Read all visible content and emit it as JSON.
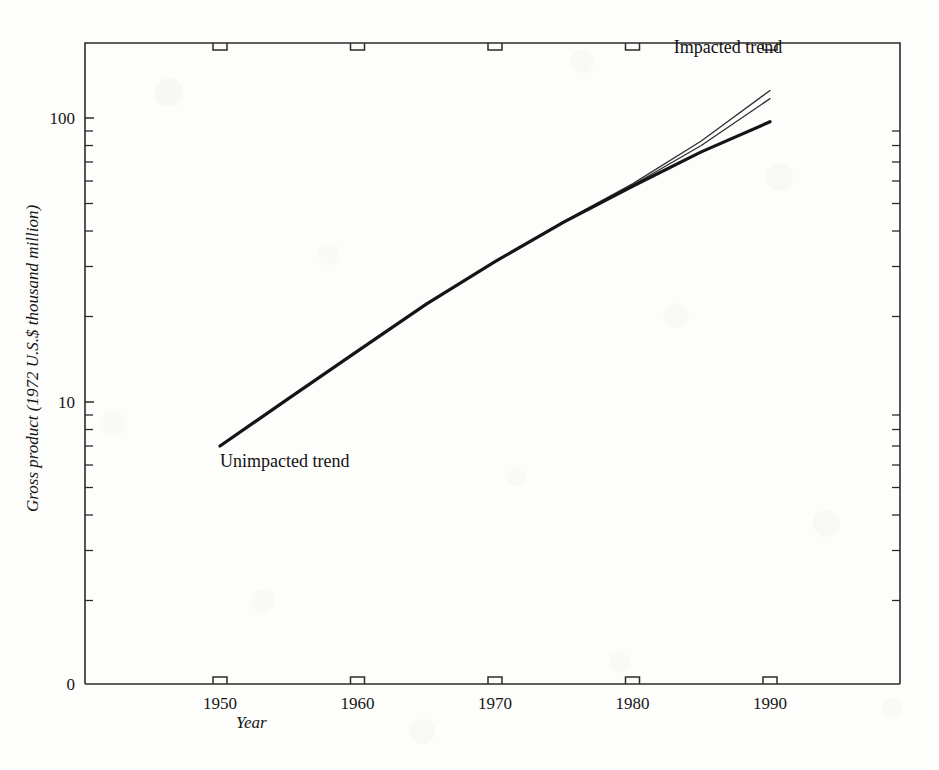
{
  "figure": {
    "name": "gross-product-log-trend-chart",
    "background_color": "#fdfdfb",
    "ink_color": "#1a1a1a"
  },
  "chart_data": {
    "type": "line",
    "title": "",
    "xlabel": "Year",
    "ylabel": "Gross product (1972 U.S.$ thousand million)",
    "yscale": "log",
    "ylim": [
      7,
      200
    ],
    "xlim": [
      1946,
      1995
    ],
    "grid": false,
    "legend_position": "inline-annotations",
    "x_ticks": [
      1950,
      1960,
      1970,
      1980,
      1990
    ],
    "x_tick_labels": [
      "1950",
      "1960",
      "1970",
      "1980",
      "1990"
    ],
    "y_ticks": [
      10,
      100,
      200
    ],
    "y_tick_labels": [
      "10",
      "100",
      "200"
    ],
    "y_axis_origin_label": "0",
    "y_minor_ticks": [
      20,
      30,
      40,
      50,
      60,
      70,
      80,
      90,
      200,
      300,
      400,
      500,
      600,
      700,
      800,
      900
    ],
    "x": [
      1950,
      1955,
      1960,
      1965,
      1970,
      1975,
      1980,
      1985,
      1990
    ],
    "series": [
      {
        "name": "Unimpacted trend",
        "style": "thick-solid",
        "color": "#151515",
        "linewidth": 3.2,
        "values": [
          7.0,
          10.3,
          15.1,
          22.1,
          31.2,
          43.0,
          57.5,
          76.0,
          97.0
        ]
      },
      {
        "name": "Impacted trend (upper)",
        "style": "thin-solid",
        "color": "#303030",
        "linewidth": 1.3,
        "values": [
          7.0,
          10.3,
          15.1,
          22.1,
          31.3,
          43.3,
          58.6,
          83.0,
          125.0
        ]
      },
      {
        "name": "Impacted trend (lower)",
        "style": "thin-solid",
        "color": "#303030",
        "linewidth": 1.3,
        "values": [
          7.0,
          10.3,
          15.1,
          22.1,
          31.2,
          43.1,
          58.0,
          80.0,
          117.0
        ]
      }
    ],
    "annotations": [
      {
        "text": "Impacted trend",
        "x": 1983,
        "y": 170,
        "align": "start"
      },
      {
        "text": "Unimpacted trend",
        "x": 1950,
        "y": 5.9,
        "align": "start"
      }
    ]
  }
}
